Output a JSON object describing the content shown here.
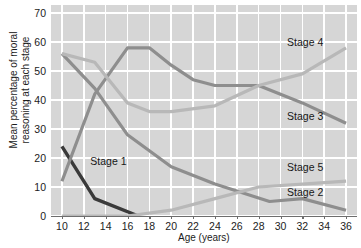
{
  "chart_data": {
    "type": "line",
    "title": "",
    "xlabel": "Age (years)",
    "ylabel": "Mean percentage of moral reasoning at each stage",
    "ylabel_line1": "Mean percentage of moral",
    "ylabel_line2": "reasoning at each stage",
    "xlim": [
      9,
      37
    ],
    "ylim": [
      0,
      70
    ],
    "grid": true,
    "legend_position": "inline-right",
    "yticks": [
      0,
      10,
      20,
      30,
      40,
      50,
      60,
      70
    ],
    "xticks": [
      10,
      12,
      14,
      16,
      18,
      20,
      22,
      24,
      26,
      28,
      30,
      32,
      34,
      36
    ],
    "colors": {
      "stage1": "#3a3a3a",
      "stage2": "#8e8e8e",
      "stage3": "#8e8e8e",
      "stage4": "#b8b8b8",
      "stage5": "#b8b8b8",
      "plot_background": "#d6d6d6",
      "gridline": "#ffffff",
      "axis": "#6d6d6d",
      "text": "#1c1c1c"
    },
    "series": [
      {
        "name": "Stage 1",
        "color": "#3a3a3a",
        "label_x": 12.6,
        "label_y": 18.5,
        "x": [
          10,
          13,
          17
        ],
        "values": [
          24,
          6,
          0
        ]
      },
      {
        "name": "Stage 2",
        "color": "#8e8e8e",
        "label_x": 30.6,
        "label_y": 8.0,
        "x": [
          10,
          13,
          16,
          20,
          24,
          29,
          32,
          36
        ],
        "values": [
          56,
          44,
          28,
          17,
          11,
          5,
          6,
          2
        ]
      },
      {
        "name": "Stage 3",
        "color": "#8e8e8e",
        "label_x": 30.6,
        "label_y": 34.0,
        "x": [
          10,
          13,
          16,
          18,
          20,
          22,
          24,
          28,
          32,
          36
        ],
        "values": [
          12,
          42,
          58,
          58,
          52,
          47,
          45,
          45,
          39,
          32
        ]
      },
      {
        "name": "Stage 4",
        "color": "#b8b8b8",
        "label_x": 30.6,
        "label_y": 59.5,
        "x": [
          10,
          13,
          16,
          18,
          20,
          24,
          28,
          32,
          36
        ],
        "values": [
          56,
          53,
          39,
          36,
          36,
          38,
          45,
          49,
          58
        ]
      },
      {
        "name": "Stage 5",
        "color": "#b8b8b8",
        "label_x": 30.6,
        "label_y": 16.5,
        "x": [
          10,
          16,
          20,
          24,
          28,
          32,
          36
        ],
        "values": [
          0,
          0,
          2,
          6,
          10,
          11,
          12
        ]
      }
    ]
  }
}
